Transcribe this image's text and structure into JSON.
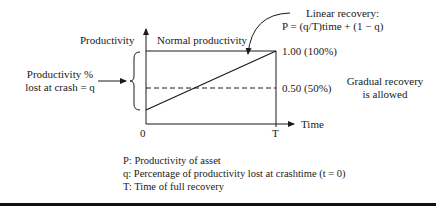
{
  "diagram": {
    "y_axis_label": "Productivity",
    "top_region_label": "Normal productivity",
    "left_annotation": [
      "Productivity %",
      "lost at crash = q"
    ],
    "curve_annotation": [
      "Linear recovery:",
      "P = (q/T)time + (1 − q)"
    ],
    "level_labels": {
      "full": "1.00 (100%)",
      "half": "0.50 (50%)"
    },
    "right_note": [
      "Gradual recovery",
      "is allowed"
    ],
    "x_axis": {
      "origin": "0",
      "end_tick": "T",
      "label": "Time"
    },
    "legend": [
      "P: Productivity of asset",
      "q: Percentage of productivity lost at crashtime (t = 0)",
      "T: Time of full recovery"
    ],
    "colors": {
      "ink": "#1a1a1a",
      "background": "#ffffff"
    }
  }
}
